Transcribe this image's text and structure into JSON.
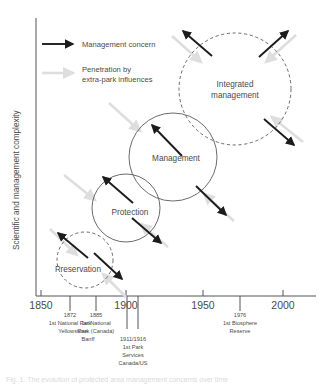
{
  "figure": {
    "type": "conceptual-diagram",
    "caption": "Fig. 1. The evolution of protected area management concerns over time"
  },
  "axes": {
    "y_title": "Scientific and management complexity",
    "x_ticks": [
      {
        "label": "1850",
        "year": 1850
      },
      {
        "label": "1900",
        "year": 1900
      },
      {
        "label": "1950",
        "year": 1950
      },
      {
        "label": "2000",
        "year": 2000
      }
    ]
  },
  "events": [
    {
      "year_label": "1872",
      "year": 1872,
      "lines": [
        "1st National Park",
        "Yellowstone"
      ]
    },
    {
      "year_label": "1885",
      "year": 1885,
      "lines": [
        "1st National",
        "Park (Canada)",
        "Banff"
      ]
    },
    {
      "year_label": "1911/1916",
      "year": 1913,
      "lines": [
        "1st Park",
        "Services",
        "Canada/US"
      ]
    },
    {
      "year_label": "1976",
      "year": 1976,
      "lines": [
        "1st Biosphere",
        "Reserve"
      ]
    }
  ],
  "legend": {
    "items": [
      {
        "label": "Management concern",
        "style": "dark-arrow",
        "color": "#1c1c1c"
      },
      {
        "label": "Penetration by extra-park influences",
        "label_line1": "Penetration by",
        "label_line2": "extra-park influences",
        "style": "light-arrow",
        "color": "#dedede"
      }
    ]
  },
  "bubbles": [
    {
      "name": "preservation",
      "label": "Preservation",
      "label_line1": "Preservation",
      "label_line2": "",
      "border": "dashed"
    },
    {
      "name": "protection",
      "label": "Protection",
      "label_line1": "Protection",
      "label_line2": "",
      "border": "solid"
    },
    {
      "name": "management",
      "label": "Management",
      "label_line1": "Management",
      "label_line2": "",
      "border": "solid"
    },
    {
      "name": "integrated-management",
      "label": "Integrated management",
      "label_line1": "Integrated",
      "label_line2": "management",
      "border": "dashed"
    }
  ],
  "colors": {
    "axis": "#555555",
    "circle_stroke": "#5a5a5a",
    "arrow_dark": "#1c1c1c",
    "arrow_light": "#dedede",
    "text": "#4a4a4a",
    "background": "#ffffff"
  }
}
